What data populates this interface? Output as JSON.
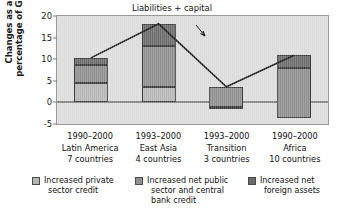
{
  "chart_data": {
    "type": "bar",
    "title": "",
    "subtitle": "",
    "xlabel": "",
    "ylabel": "Changes as a percentage of GDP",
    "ylabel_line1": "Changes as a",
    "ylabel_line2": "percentage of GDP",
    "ylim": [
      -5,
      20
    ],
    "yticks": [
      20,
      15,
      10,
      5,
      0,
      -5
    ],
    "ytick_labels": [
      "20",
      "15",
      "10",
      "5",
      "0",
      "-5"
    ],
    "grid": false,
    "legend_position": "bottom",
    "stacked": true,
    "categories": [
      "1990–2000 Latin America 7 countries",
      "1993–2000 East Asia 4 countries",
      "1993–2000 Transition 3 countries",
      "1990–2000 Africa 10 countries"
    ],
    "category_labels": [
      {
        "period": "1990–2000",
        "region": "Latin America",
        "countries": "7 countries"
      },
      {
        "period": "1993–2000",
        "region": "East Asia",
        "countries": "4 countries"
      },
      {
        "period": "1993–2000",
        "region": "Transition",
        "countries": "3 countries"
      },
      {
        "period": "1990–2000",
        "region": "Africa",
        "countries": "10 countries"
      }
    ],
    "series": [
      {
        "name": "Increased private sector credit",
        "color": "#b6b6b6",
        "values": [
          4.6,
          3.5,
          0.0,
          0.0
        ]
      },
      {
        "name": "Increased net public sector and central bank credit",
        "color": "#8f8f8f",
        "values": [
          4.1,
          9.6,
          4.6,
          11.4
        ]
      },
      {
        "name": "Increased net foreign assets",
        "color": "#6b6b6b",
        "values": [
          1.6,
          5.1,
          -1.0,
          3.0
        ]
      }
    ],
    "bar_segments": [
      [
        {
          "from": 0.0,
          "to": 4.6,
          "series": 0
        },
        {
          "from": 4.6,
          "to": 8.7,
          "series": 1
        },
        {
          "from": 8.7,
          "to": 10.3,
          "series": 2
        }
      ],
      [
        {
          "from": 0.0,
          "to": 3.5,
          "series": 0
        },
        {
          "from": 3.5,
          "to": 13.1,
          "series": 1
        },
        {
          "from": 13.1,
          "to": 18.2,
          "series": 2
        }
      ],
      [
        {
          "from": -1.0,
          "to": 3.6,
          "series": 1
        },
        {
          "from": -1.4,
          "to": -1.0,
          "series": 2
        }
      ],
      [
        {
          "from": -3.5,
          "to": 7.9,
          "series": 1
        },
        {
          "from": 7.9,
          "to": 10.9,
          "series": 2
        }
      ]
    ],
    "line_series": {
      "name": "Liabilities + capital",
      "color": "#1a1a1a",
      "values": [
        10.3,
        18.2,
        3.6,
        10.9
      ]
    },
    "annotation": {
      "text": "Liabilities + capital",
      "points_to_category": "1993–2000 Transition 3 countries"
    },
    "legend": [
      {
        "label_line1": "Increased private",
        "label_line2": "sector credit",
        "label_line3": "",
        "color": "#b6b6b6"
      },
      {
        "label_line1": "Increased net public",
        "label_line2": "sector and central",
        "label_line3": "bank credit",
        "color": "#8f8f8f"
      },
      {
        "label_line1": "Increased net",
        "label_line2": "foreign assets",
        "label_line3": "",
        "color": "#6b6b6b"
      }
    ]
  }
}
